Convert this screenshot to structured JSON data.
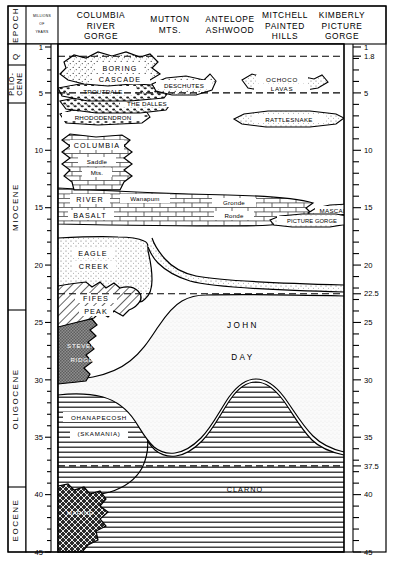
{
  "header": {
    "epoch_label": "EPOCH",
    "scale_label_lines": [
      "MILLIONS",
      "OF",
      "YEARS"
    ],
    "columns": [
      {
        "id": "columbia-river-gorge",
        "lines": [
          "COLUMBIA",
          "RIVER",
          "GORGE"
        ]
      },
      {
        "id": "mutton-mts",
        "lines": [
          "MUTTON",
          "MTS."
        ]
      },
      {
        "id": "antelope-ashwood",
        "lines": [
          "ANTELOPE",
          "ASHWOOD"
        ]
      },
      {
        "id": "mitchell-painted-hills",
        "lines": [
          "MITCHELL",
          "PAINTED",
          "HILLS"
        ]
      },
      {
        "id": "kimberly-picture-gorge",
        "lines": [
          "KIMBERLY",
          "PICTURE",
          "GORGE"
        ]
      }
    ]
  },
  "epochs": [
    {
      "id": "quaternary",
      "label": "Q",
      "from": 0.0,
      "to": 1.8
    },
    {
      "id": "pliocene",
      "label": "PLIO-CENE",
      "line1": "PLIO-",
      "line2": "CENE",
      "from": 1.8,
      "to": 5.0
    },
    {
      "id": "miocene",
      "label": "MIOCENE",
      "from": 5.0,
      "to": 22.5
    },
    {
      "id": "oligocene",
      "label": "OLIGOCENE",
      "from": 22.5,
      "to": 37.5
    },
    {
      "id": "eocene",
      "label": "EOCENE",
      "from": 37.5,
      "to": 45.0
    }
  ],
  "axis": {
    "unit": "millions of years",
    "min": 0,
    "max": 45,
    "major_ticks": [
      1,
      5,
      10,
      15,
      20,
      25,
      30,
      35,
      40,
      45
    ],
    "left_labels": [
      "1",
      "5",
      "10",
      "15",
      "20",
      "25",
      "30",
      "35",
      "40",
      "45"
    ],
    "right_labels": [
      "1",
      "1.8",
      "5",
      "10",
      "15",
      "20",
      "22.5",
      "25",
      "30",
      "35",
      "37.5",
      "40",
      "45"
    ],
    "right_tick_values": [
      1,
      1.8,
      5,
      10,
      15,
      20,
      22.5,
      25,
      30,
      35,
      37.5,
      40,
      45
    ],
    "minor_interval": 1,
    "boundary_dashed_values": [
      1.8,
      5.0,
      22.5,
      37.5
    ]
  },
  "units": [
    {
      "id": "boring",
      "label": "BORING",
      "texture": "stipple-coarse"
    },
    {
      "id": "cascade",
      "label": "CASCADE",
      "texture": "stipple-coarse"
    },
    {
      "id": "troutdale",
      "label": "TROUTDALE",
      "texture": "gravel-dark"
    },
    {
      "id": "the-dalles",
      "label": "THE DALLES",
      "texture": "gravel-dark"
    },
    {
      "id": "rhododendron",
      "label": "RHODODENDRON",
      "texture": "gravel-mid"
    },
    {
      "id": "deschutes",
      "label": "DESCHUTES",
      "texture": "stipple-coarse"
    },
    {
      "id": "ochoco-lavas",
      "label": "OCHOCO",
      "label2": "LAVAS",
      "texture": "stipple-fine"
    },
    {
      "id": "rattlesnake",
      "label": "RATTLESNAKE",
      "texture": "stipple-fine"
    },
    {
      "id": "columbia",
      "label": "COLUMBIA",
      "texture": "brick"
    },
    {
      "id": "saddle-mts",
      "label": "Saddle",
      "label2": "Mts.",
      "texture": "brick"
    },
    {
      "id": "river",
      "label": "RIVER",
      "texture": "brick"
    },
    {
      "id": "basalt",
      "label": "BASALT",
      "texture": "brick"
    },
    {
      "id": "wanapum",
      "label": "Wanapum",
      "texture": "brick"
    },
    {
      "id": "grande-ronde",
      "label": "Gronde",
      "label2": "Ronde",
      "texture": "brick"
    },
    {
      "id": "mascall",
      "label": "MASCALL",
      "texture": "stipple-fine"
    },
    {
      "id": "picture-gorge",
      "label": "PICTURE GORGE",
      "texture": "stipple-fine"
    },
    {
      "id": "eagle-creek",
      "label": "EAGLE",
      "label2": "CREEK",
      "texture": "stipple-fine"
    },
    {
      "id": "fifes-peak",
      "label": "FIFES",
      "label2": "PEAK",
      "texture": "diag-hatch"
    },
    {
      "id": "stevens-ridge",
      "label": "STEVENS",
      "label2": "RIDGE",
      "texture": "checker-gray"
    },
    {
      "id": "ohanapecosh",
      "label": "OHANAPECOSH",
      "label2": "(SKAMANIA)",
      "texture": "horiz-lines"
    },
    {
      "id": "john-day",
      "label": "JOHN",
      "label2": "DAY",
      "texture": "stipple-vfine"
    },
    {
      "id": "clarno",
      "label": "CLARNO",
      "texture": "horiz-lines"
    },
    {
      "id": "marine",
      "label": "MARINE",
      "texture": "cross-hatch-dark"
    }
  ],
  "colors": {
    "ink": "#000000",
    "paper": "#ffffff",
    "stipple_light": "#f2f2f2",
    "gray_mid": "#8c8c8c",
    "gray_dark": "#3a3a3a"
  }
}
